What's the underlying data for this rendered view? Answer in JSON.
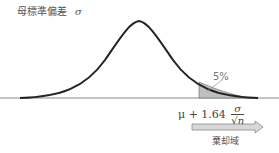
{
  "title": {
    "text": "母標準偏差",
    "symbol": "σ"
  },
  "labels": {
    "percent": "5%",
    "formula_prefix": "μ + 1.64",
    "formula_num": "σ",
    "formula_den": "√n",
    "region": "棄却域"
  },
  "colors": {
    "curve": "#222222",
    "axis": "#888888",
    "shade": "#bfbfbf",
    "arrow_fill": "#d8d8d8",
    "arrow_stroke": "#888888"
  }
}
